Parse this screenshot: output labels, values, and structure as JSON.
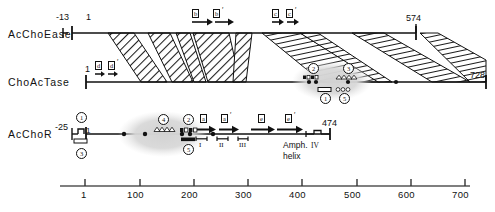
{
  "figure": {
    "type": "protein-domain-alignment-diagram",
    "axis": {
      "label_ticks": [
        "1",
        "100",
        "200",
        "300",
        "400",
        "500",
        "600",
        "700"
      ],
      "tick_values": [
        1,
        100,
        200,
        300,
        400,
        500,
        600,
        700
      ],
      "range": [
        1,
        720
      ]
    },
    "rows": [
      {
        "id": "acchoease",
        "label": "AcChoEase",
        "start_label": "-13",
        "one_label": "1",
        "end_label": "574",
        "boxed_symbols": [
          {
            "text": "b",
            "prime": false
          },
          {
            "text": "b",
            "prime": true
          },
          {
            "text": "c",
            "prime": false
          },
          {
            "text": "c",
            "prime": true
          }
        ]
      },
      {
        "id": "choactase",
        "label": "ChoAcTase",
        "start_label": "1",
        "end_label": "728",
        "boxed_symbols": [
          {
            "text": "d",
            "prime": false
          },
          {
            "text": "d",
            "prime": true
          }
        ],
        "circled_markers": [
          "2",
          "3",
          "1",
          "5"
        ]
      },
      {
        "id": "acchor",
        "label": "AcChoR",
        "start_label": "-25",
        "one_label": "1",
        "end_label": "474",
        "boxed_symbols": [
          {
            "text": "a",
            "prime": false
          },
          {
            "text": "a",
            "prime": true
          },
          {
            "text": "e",
            "prime": false
          },
          {
            "text": "e",
            "prime": true
          }
        ],
        "circled_markers": [
          "1",
          "3",
          "4",
          "2",
          "5"
        ],
        "roman_numerals": [
          "I",
          "II",
          "III",
          "IV"
        ],
        "amph_helix_line1": "Amph.",
        "amph_helix_line2": "helix",
        "amph_helix_roman": "IV"
      }
    ],
    "colors": {
      "ink": "#111111",
      "hatch": "#1a1a1a",
      "halo": "#d9d9d9",
      "paper": "#ffffff"
    }
  }
}
